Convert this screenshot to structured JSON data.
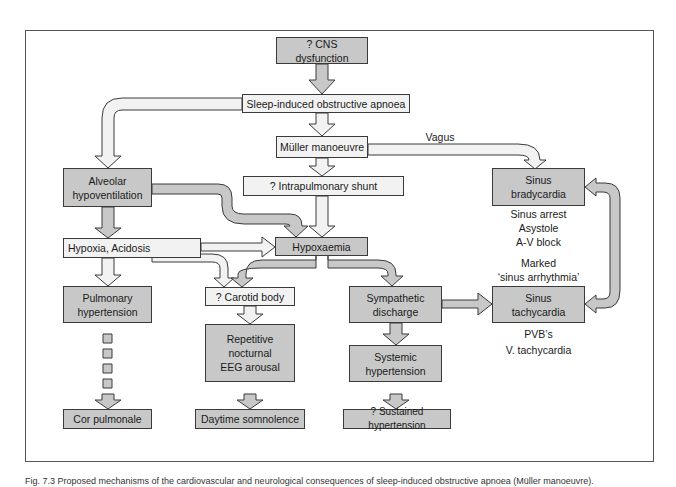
{
  "diagram": {
    "nodes": {
      "cns": "? CNS dysfunction",
      "apnoea": "Sleep-induced  obstructive apnoea",
      "muller": "Müller  manoeuvre",
      "shunt": "?  Intrapulmonary  shunt",
      "alveolar": "Alveolar\nhypoventilation",
      "brady": "Sinus\nbradycardia",
      "hypoxia": "Hypoxia, Acidosis",
      "hypoxaemia": "Hypoxaemia",
      "pulm_htn": "Pulmonary\nhypertension",
      "carotid": "?  Carotid  body",
      "sympathetic": "Sympathetic\ndischarge",
      "tachy": "Sinus\ntachycardia",
      "eeg": "Repetitive\nnocturnal\nEEG  arousal",
      "systemic": "Systemic\nhypertension",
      "cor": "Cor pulmonale",
      "somnolence": "Daytime  somnolence",
      "sustained": "? Sustained hypertension"
    },
    "labels": {
      "vagus": "Vagus",
      "brady_notes": "Sinus  arrest\nAsystole\nA-V  block",
      "marked": "Marked\n‘sinus  arrhythmia’",
      "pvb": "PVB’s",
      "vtach": "V. tachycardia"
    },
    "colors": {
      "gray_box": "#c8c8c8",
      "light_box": "#f2f2f2",
      "outline": "#3a3a3a"
    },
    "edges": [
      {
        "from": "cns",
        "to": "apnoea"
      },
      {
        "from": "apnoea",
        "to": "muller"
      },
      {
        "from": "apnoea",
        "to": "alveolar"
      },
      {
        "from": "muller",
        "to": "shunt"
      },
      {
        "from": "muller",
        "to": "brady",
        "label": "Vagus"
      },
      {
        "from": "shunt",
        "to": "hypoxaemia"
      },
      {
        "from": "alveolar",
        "to": "hypoxia"
      },
      {
        "from": "alveolar",
        "to": "hypoxaemia"
      },
      {
        "from": "hypoxia",
        "to": "hypoxaemia"
      },
      {
        "from": "hypoxia",
        "to": "carotid"
      },
      {
        "from": "hypoxia",
        "to": "pulm_htn"
      },
      {
        "from": "hypoxaemia",
        "to": "carotid"
      },
      {
        "from": "hypoxaemia",
        "to": "sympathetic"
      },
      {
        "from": "carotid",
        "to": "eeg"
      },
      {
        "from": "eeg",
        "to": "somnolence"
      },
      {
        "from": "pulm_htn",
        "to": "cor",
        "style": "dashed"
      },
      {
        "from": "sympathetic",
        "to": "tachy"
      },
      {
        "from": "sympathetic",
        "to": "systemic"
      },
      {
        "from": "systemic",
        "to": "sustained"
      },
      {
        "from": "brady",
        "to": "tachy",
        "style": "bidirectional"
      }
    ]
  },
  "caption": "Fig. 7.3  Proposed mechanisms of the cardiovascular and neurological consequences of sleep-induced obstructive apnoea (Müller manoeuvre)."
}
